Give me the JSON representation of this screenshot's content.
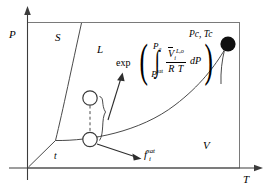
{
  "figure": {
    "type": "phase-diagram",
    "axes": {
      "y_label": "P",
      "x_label": "T"
    },
    "regions": [
      {
        "key": "solid",
        "label": "S"
      },
      {
        "key": "liquid",
        "label": "L"
      },
      {
        "key": "vapor",
        "label": "V"
      }
    ],
    "points": [
      {
        "key": "critical",
        "label": "Pc, Tc",
        "style": "filled-circle"
      },
      {
        "key": "triple",
        "label": "t",
        "style": "line-junction"
      },
      {
        "key": "state-sat",
        "label": "",
        "style": "open-circle"
      },
      {
        "key": "state-upper",
        "label": "",
        "style": "open-circle"
      }
    ],
    "annotations": {
      "exp_label": "exp",
      "fugacity_label": "f",
      "fugacity_sub": "i",
      "fugacity_sup": "sat"
    },
    "integral": {
      "open_paren": "(",
      "close_paren": ")",
      "upper_limit_main": "P",
      "upper_limit_sub": "2",
      "lower_limit_main": "P",
      "lower_limit_sup": "sat",
      "integral_sign": "∫",
      "numerator_main": "V",
      "numerator_sub": "i",
      "numerator_sup": "L,o",
      "denominator": "R T",
      "differential": "dP"
    }
  },
  "colors": {
    "ink": "#000000",
    "frame": "#6f6f6f",
    "background": "#ffffff"
  }
}
